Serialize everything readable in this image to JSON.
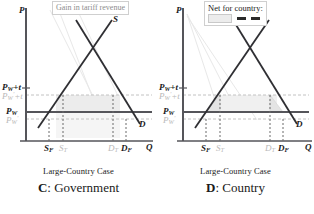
{
  "figure": {
    "panels": [
      {
        "id": "C",
        "caption_sub": "Large-Country Case",
        "caption_letter": "C",
        "caption_label": ": Government",
        "legend": {
          "text": "Gain in tariff revenue",
          "symbols": []
        },
        "axes": {
          "ylabel": "P",
          "xlabel": "Q",
          "yticks": [
            {
              "label": "P",
              "sub": "W",
              "extra": "+t",
              "faint": false
            },
            {
              "label": "P",
              "sub": "W",
              "sup": "′",
              "extra": "+t",
              "faint": true
            },
            {
              "label": "P",
              "sub": "W",
              "extra": "",
              "faint": false
            },
            {
              "label": "P",
              "sub": "W",
              "sup": "′",
              "extra": "",
              "faint": true
            }
          ],
          "xticks": [
            {
              "label": "S",
              "sub": "F",
              "faint": false
            },
            {
              "label": "S",
              "sub": "T",
              "faint": true
            },
            {
              "label": "D",
              "sub": "T",
              "faint": true
            },
            {
              "label": "D",
              "sub": "F",
              "faint": false
            }
          ]
        },
        "curves": [
          {
            "name": "S",
            "label": "S"
          },
          {
            "name": "D",
            "label": "D"
          }
        ]
      },
      {
        "id": "D",
        "caption_sub": "Large-Country Case",
        "caption_letter": "D",
        "caption_label": ": Country",
        "legend": {
          "text": "Net for country:",
          "symbols": [
            "swatch",
            "minus",
            "minus"
          ]
        },
        "axes": {
          "ylabel": "P",
          "xlabel": "Q",
          "yticks": [
            {
              "label": "P",
              "sub": "W",
              "extra": "+t",
              "faint": false
            },
            {
              "label": "P",
              "sub": "W",
              "sup": "′",
              "extra": "+t",
              "faint": true
            },
            {
              "label": "P",
              "sub": "W",
              "extra": "",
              "faint": false
            },
            {
              "label": "P",
              "sub": "W",
              "sup": "′",
              "extra": "",
              "faint": true
            }
          ],
          "xticks": [
            {
              "label": "S",
              "sub": "F",
              "faint": false
            },
            {
              "label": "S",
              "sub": "T",
              "faint": true
            },
            {
              "label": "D",
              "sub": "T",
              "faint": true
            },
            {
              "label": "D",
              "sub": "F",
              "faint": false
            }
          ]
        },
        "curves": [
          {
            "name": "S",
            "label": "S"
          },
          {
            "name": "D",
            "label": "D"
          }
        ]
      }
    ],
    "colors": {
      "axis": "#55555a",
      "curve": "#2f2f33",
      "faint": "#c2c2c2",
      "shade": "#ececec",
      "legend_border": "#cfcfcf",
      "price_line": "#55555a"
    }
  }
}
